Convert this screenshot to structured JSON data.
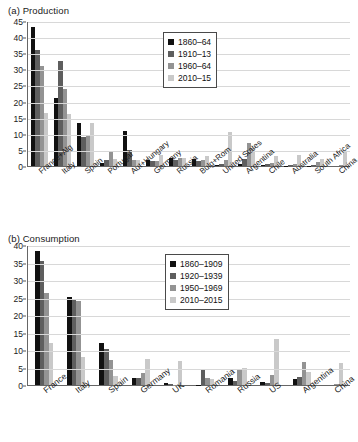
{
  "panels": [
    {
      "key": "a",
      "title": "(a) Production",
      "legend_title": "",
      "chart": {
        "type": "bar",
        "title": "(a) Production",
        "xlabel": "",
        "ylabel": "",
        "ylim": [
          0,
          45
        ],
        "yticks": [
          0,
          5,
          10,
          15,
          20,
          25,
          30,
          35,
          40,
          45
        ],
        "grid": true,
        "legend_position": "top-center",
        "categories": [
          "France+Alg",
          "Italy",
          "Spain",
          "Portugal",
          "Aut+Hungary",
          "Germany",
          "Russia",
          "Bulg+Rom",
          "United States",
          "Argentina",
          "Chile",
          "Australia",
          "South Africa",
          "China"
        ],
        "series": [
          {
            "name": "1860–64",
            "color": "#111111",
            "values": [
              43.0,
              21.0,
              13.5,
              1.0,
              10.8,
              1.8,
              2.4,
              2.2,
              0.2,
              0.5,
              0.2,
              0.1,
              0.1,
              0.0
            ]
          },
          {
            "name": "1910–13",
            "color": "#5e5e5e",
            "values": [
              36.0,
              32.5,
              9.0,
              1.8,
              5.0,
              1.5,
              2.0,
              1.5,
              0.6,
              2.3,
              0.6,
              0.3,
              0.4,
              0.0
            ]
          },
          {
            "name": "1960–64",
            "color": "#939393",
            "values": [
              31.0,
              24.0,
              9.2,
              4.3,
              2.0,
              1.6,
              2.6,
              2.0,
              1.8,
              7.2,
              1.0,
              0.5,
              1.1,
              0.2
            ]
          },
          {
            "name": "2010–15",
            "color": "#c9c9c9",
            "values": [
              16.5,
              16.0,
              13.5,
              2.3,
              1.8,
              3.3,
              2.5,
              3.0,
              10.5,
              5.5,
              3.2,
              3.3,
              2.1,
              4.5
            ]
          }
        ]
      }
    },
    {
      "key": "b",
      "title": "(b) Consumption",
      "legend_title": "",
      "chart": {
        "type": "bar",
        "title": "(b) Consumption",
        "xlabel": "",
        "ylabel": "",
        "ylim": [
          0,
          40
        ],
        "yticks": [
          0,
          5,
          10,
          15,
          20,
          25,
          30,
          35,
          40
        ],
        "grid": true,
        "legend_position": "top-center",
        "categories": [
          "France",
          "Italy",
          "Spain",
          "Germany",
          "UK",
          "Romania",
          "Russia",
          "US",
          "Argentina",
          "China"
        ],
        "series": [
          {
            "name": "1860–1909",
            "color": "#111111",
            "values": [
              38.2,
              25.1,
              12.1,
              2.1,
              0.5,
              0.05,
              2.1,
              0.8,
              1.7,
              0.0
            ]
          },
          {
            "name": "1920–1939",
            "color": "#5e5e5e",
            "values": [
              35.5,
              24.4,
              10.4,
              2.1,
              0.3,
              4.2,
              1.2,
              0.7,
              2.2,
              0.0
            ]
          },
          {
            "name": "1950–1969",
            "color": "#939393",
            "values": [
              26.2,
              24.0,
              7.2,
              3.5,
              0.1,
              2.0,
              4.4,
              2.8,
              6.7,
              0.2
            ]
          },
          {
            "name": "2010–2015",
            "color": "#c9c9c9",
            "values": [
              11.9,
              8.0,
              2.6,
              7.3,
              6.9,
              1.8,
              4.8,
              13.2,
              3.8,
              6.3
            ]
          }
        ]
      }
    }
  ]
}
